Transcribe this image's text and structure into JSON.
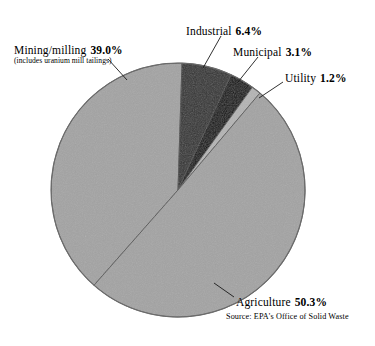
{
  "chart_data": {
    "type": "pie",
    "title": "",
    "subtitle": "",
    "legend_position": "callout-labels",
    "grid": false,
    "source": "Source: EPA's Office of Solid Waste",
    "categories": [
      "Agriculture",
      "Mining/milling",
      "Industrial",
      "Municipal",
      "Utility"
    ],
    "values": [
      50.3,
      39.0,
      6.4,
      3.1,
      1.2
    ],
    "unit": "%",
    "series": [
      {
        "name": "Share of waste",
        "values": [
          50.3,
          39.0,
          6.4,
          3.1,
          1.2
        ]
      }
    ],
    "slices": [
      {
        "label": "Mining/milling",
        "value": 39.0,
        "value_text": "39.0%",
        "note": "(includes uranium mill tailings)",
        "color": "#a3a3a3",
        "start_angle_deg": 221.4,
        "end_angle_deg": 361.8
      },
      {
        "label": "Industrial",
        "value": 6.4,
        "value_text": "6.4%",
        "note": "",
        "color": "#333333",
        "start_angle_deg": 361.8,
        "end_angle_deg": 384.8
      },
      {
        "label": "Municipal",
        "value": 3.1,
        "value_text": "3.1%",
        "note": "",
        "color": "#0d0d0d",
        "start_angle_deg": 384.8,
        "end_angle_deg": 395.9
      },
      {
        "label": "Utility",
        "value": 1.2,
        "value_text": "1.2%",
        "note": "",
        "color": "#b4b4b4",
        "start_angle_deg": 395.9,
        "end_angle_deg": 400.2
      },
      {
        "label": "Agriculture",
        "value": 50.3,
        "value_text": "50.3%",
        "note": "",
        "color": "#a3a3a3",
        "start_angle_deg": 400.2,
        "end_angle_deg": 581.4
      }
    ],
    "geometry": {
      "center_x": 178,
      "center_y": 190,
      "radius": 127
    },
    "colors": {
      "background": "#ffffff",
      "outline": "#555555",
      "light_gray": "#a3a3a3",
      "dark_gray": "#333333",
      "black": "#0d0d0d",
      "sliver_gray": "#b4b4b4",
      "text": "#000000",
      "leader_line": "#1a1a1a"
    }
  },
  "labels": {
    "mining": {
      "name": "Mining/milling",
      "value": "39.0%",
      "note": "(includes uranium mill tailings)"
    },
    "industrial": {
      "name": "Industrial",
      "value": "6.4%"
    },
    "municipal": {
      "name": "Municipal",
      "value": "3.1%"
    },
    "utility": {
      "name": "Utility",
      "value": "1.2%"
    },
    "agriculture": {
      "name": "Agriculture",
      "value": "50.3%"
    }
  },
  "source": {
    "text": "Source: EPA's Office of Solid Waste"
  }
}
